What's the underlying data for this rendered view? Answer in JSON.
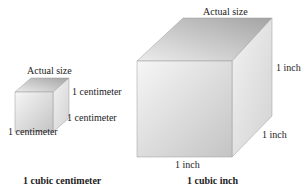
{
  "small_cube": {
    "top_label": "Actual size",
    "height_label": "1 centimeter",
    "depth_label": "1 centimeter",
    "width_label": "1 centimeter",
    "caption": "1 cubic centimeter"
  },
  "large_cube": {
    "top_label": "Actual size",
    "height_label": "1 inch",
    "depth_label": "1 inch",
    "width_label": "1 inch",
    "caption": "1 cubic inch"
  },
  "colors": {
    "front_light": "#f4f4f4",
    "front_dark": "#c9c9c9",
    "top_light": "#e2e2e2",
    "top_dark": "#a9a9a9",
    "side_light": "#ededed",
    "side_dark": "#cfcfcf",
    "edge": "#8a8a8a"
  }
}
